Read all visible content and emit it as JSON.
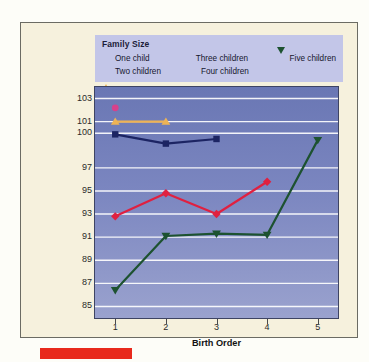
{
  "figure": {
    "background_color": "#f6f1dd",
    "border_color": "#6b6b63"
  },
  "legend": {
    "title": "Family Size",
    "background_color": "#c3c6e8",
    "items": [
      {
        "label": "One child",
        "marker": "circle",
        "color": "#d6418b",
        "icon": "circle-marker-icon"
      },
      {
        "label": "Three children",
        "marker": "square",
        "color": "#1c2463",
        "icon": "square-marker-icon"
      },
      {
        "label": "Five children",
        "marker": "triangle-down",
        "color": "#1d5230",
        "icon": "triangle-down-marker-icon"
      },
      {
        "label": "Two children",
        "marker": "triangle-up",
        "color": "#eeb355",
        "icon": "triangle-up-marker-icon"
      },
      {
        "label": "Four children",
        "marker": "diamond",
        "color": "#e02040",
        "icon": "diamond-marker-icon"
      }
    ]
  },
  "chart_data": {
    "type": "line",
    "title": "",
    "xlabel": "Birth Order",
    "ylabel": "Children's Mean Intelligence Test Score",
    "x": [
      1,
      2,
      3,
      4,
      5
    ],
    "xtick_labels": [
      "1",
      "2",
      "3",
      "4",
      "5"
    ],
    "ytick_labels": [
      "103",
      "101",
      "100",
      "97",
      "95",
      "93",
      "91",
      "89",
      "87",
      "85"
    ],
    "ytick_values": [
      103,
      101,
      100,
      97,
      95,
      93,
      91,
      89,
      87,
      85
    ],
    "ylim": [
      84,
      104
    ],
    "xlim": [
      0.6,
      5.4
    ],
    "grid": "horizontal",
    "legend_position": "top",
    "plot_background": "#7b86c0",
    "gridline_color": "#ffffff",
    "series": [
      {
        "name": "One child",
        "color": "#d6418b",
        "marker": "circle",
        "x": [
          1
        ],
        "values": [
          102.2
        ]
      },
      {
        "name": "Two children",
        "color": "#eeb355",
        "marker": "triangle-up",
        "x": [
          1,
          2
        ],
        "values": [
          101.0,
          101.0
        ]
      },
      {
        "name": "Three children",
        "color": "#1c2463",
        "marker": "square",
        "x": [
          1,
          2,
          3
        ],
        "values": [
          99.9,
          99.1,
          99.5
        ]
      },
      {
        "name": "Four children",
        "color": "#e02040",
        "marker": "diamond",
        "x": [
          1,
          2,
          3,
          4
        ],
        "values": [
          92.8,
          94.8,
          93.0,
          95.8
        ]
      },
      {
        "name": "Five children",
        "color": "#1d5230",
        "marker": "triangle-down",
        "x": [
          1,
          2,
          3,
          4,
          5
        ],
        "values": [
          86.4,
          91.1,
          91.3,
          91.2,
          99.4
        ]
      }
    ]
  },
  "footer": {
    "red_bar_color": "#e8291c"
  }
}
